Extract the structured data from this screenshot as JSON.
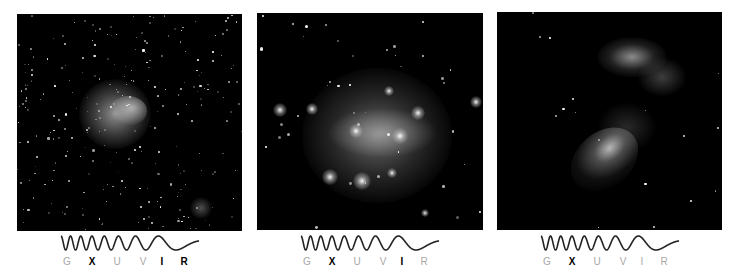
{
  "panels": [
    {
      "name": "panel-1",
      "description": "Infrared image: wide field of stars with diffuse nebula left of center and faint blob bottom-right",
      "bands": [
        {
          "label": "G",
          "active": false
        },
        {
          "label": "X",
          "active": true
        },
        {
          "label": "U",
          "active": false
        },
        {
          "label": "V",
          "active": false
        },
        {
          "label": "I",
          "active": true
        },
        {
          "label": "R",
          "active": true
        }
      ]
    },
    {
      "name": "panel-2",
      "description": "Optical/X-ray image: bright glowing cluster with many point sources",
      "bands": [
        {
          "label": "G",
          "active": false
        },
        {
          "label": "X",
          "active": true
        },
        {
          "label": "U",
          "active": false
        },
        {
          "label": "V",
          "active": false
        },
        {
          "label": "I",
          "active": true
        },
        {
          "label": "R",
          "active": false
        }
      ]
    },
    {
      "name": "panel-3",
      "description": "X-ray image: filamentary clumpy emission, upper cluster and lower swept tail",
      "bands": [
        {
          "label": "G",
          "active": false
        },
        {
          "label": "X",
          "active": true
        },
        {
          "label": "U",
          "active": false
        },
        {
          "label": "V",
          "active": false
        },
        {
          "label": "I",
          "active": false
        },
        {
          "label": "R",
          "active": false
        }
      ]
    }
  ],
  "colors": {
    "background": "#ffffff",
    "panel": "#000000",
    "active_band": "#000000",
    "inactive_band": "#a8a8a8",
    "wave": "#222222"
  }
}
